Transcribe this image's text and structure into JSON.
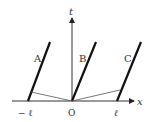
{
  "labels": {
    "t_axis": "t",
    "x_axis": "x",
    "origin": "O",
    "minus_l": "− ℓ",
    "plus_l": "ℓ",
    "line_a": "A",
    "line_b": "B",
    "line_c": "C"
  },
  "colors": {
    "axis": "#333333",
    "worldline": "#111111",
    "signal": "#555555"
  }
}
